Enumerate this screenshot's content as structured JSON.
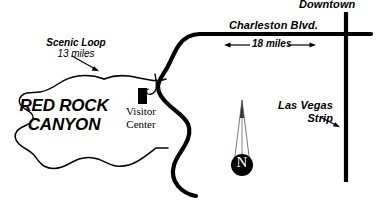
{
  "map": {
    "title": "Red Rock Canyon area road map",
    "width": 381,
    "height": 202,
    "background_color": "#ffffff",
    "ink_color": "#000000",
    "labels": {
      "downtown": "Downtown",
      "charleston_blvd": "Charleston Blvd.",
      "distance_charleston": "18 miles",
      "scenic_loop_name": "Scenic Loop",
      "scenic_loop_distance": "13 miles",
      "park_name_line1": "RED ROCK",
      "park_name_line2": "CANYON",
      "visitor_center_line1": "Visitor",
      "visitor_center_line2": "Center",
      "las_vegas_strip_line1": "Las Vegas",
      "las_vegas_strip_line2": "Strip",
      "north_indicator": "N"
    },
    "icons": {
      "visitor_center_marker": "building-marker-icon",
      "north_arrow": "north-arrow-icon",
      "scenic_loop_pointer": "arrow-pointer-icon",
      "strip_pointer": "arrow-pointer-icon",
      "distance_measure": "double-headed-arrow-icon"
    },
    "features": {
      "park_boundary": "red-rock-canyon-outline",
      "main_highway": "state-route-159",
      "east_west_highway": "charleston-blvd",
      "north_south_highway": "las-vegas-strip-road",
      "access_road": "visitor-center-access-road"
    }
  }
}
